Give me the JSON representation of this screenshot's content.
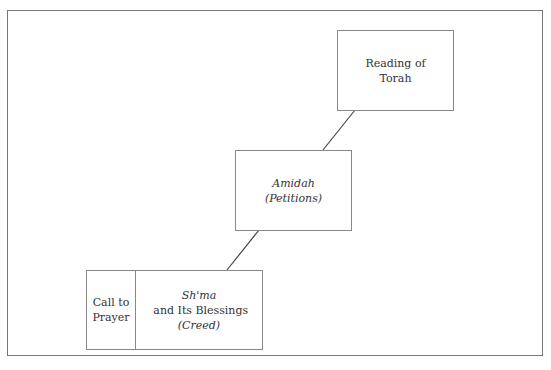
{
  "diagram": {
    "type": "staircase-flow",
    "nodes": [
      {
        "id": "reading-of-torah",
        "lines": [
          "Reading of",
          "Torah"
        ]
      },
      {
        "id": "amidah",
        "title": "Amidah",
        "subtitle": "(Petitions)"
      },
      {
        "id": "shma-group",
        "cells": [
          {
            "id": "call-to-prayer",
            "lines": [
              "Call to",
              "Prayer"
            ]
          },
          {
            "id": "shma",
            "title_italic": "Sh'ma",
            "title_rest": " and Its Blessings",
            "subtitle": "(Creed)"
          }
        ]
      }
    ],
    "edges": [
      {
        "from": "shma-group",
        "to": "amidah"
      },
      {
        "from": "amidah",
        "to": "reading-of-torah"
      }
    ],
    "colors": {
      "border": "#888888",
      "frame": "#777777",
      "text": "#333333",
      "line": "#444444"
    }
  }
}
